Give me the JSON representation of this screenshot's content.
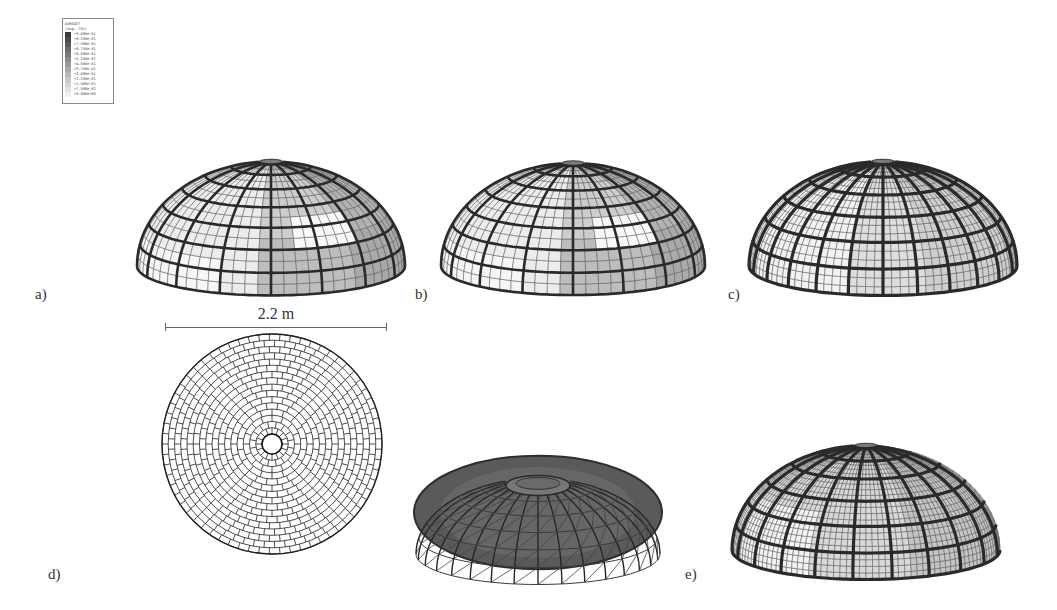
{
  "figure": {
    "panels": [
      {
        "id": "a",
        "label": "a)",
        "description": "Dome damage contour, view 1"
      },
      {
        "id": "b",
        "label": "b)",
        "description": "Dome damage contour, view 2"
      },
      {
        "id": "c",
        "label": "c)",
        "description": "Dome with uniform rib mesh"
      },
      {
        "id": "d",
        "label": "d)",
        "description": "Top-view brick pattern and deformed solid mesh"
      },
      {
        "id": "e",
        "label": "e)",
        "description": "Dome with refined mesh"
      }
    ],
    "dimension": {
      "label": "2.2 m"
    },
    "legend": {
      "title": "DAMAGET",
      "subtitle": "(Avg: 75%)",
      "values": [
        "+9.000e-01",
        "+8.250e-01",
        "+7.500e-01",
        "+6.750e-01",
        "+6.000e-01",
        "+5.250e-01",
        "+4.500e-01",
        "+3.750e-01",
        "+3.000e-01",
        "+2.250e-01",
        "+1.500e-01",
        "+7.500e-02",
        "+0.000e+00"
      ],
      "colors": [
        "#3a3a3a",
        "#4a4a4a",
        "#5a5a5a",
        "#6a6a6a",
        "#7a7a7a",
        "#8a8a8a",
        "#9a9a9a",
        "#aaaaaa",
        "#b8b8b8",
        "#c6c6c6",
        "#d4d4d4",
        "#e2e2e2",
        "#f0f0f0"
      ]
    },
    "colors": {
      "rib": "#2a2a2a",
      "mesh_line": "#555555",
      "light_face": "#f4f4f4",
      "mid_face": "#c9c9c9",
      "dark_face": "#a8a8a8",
      "solid_dome": "#5a5a5a"
    }
  }
}
